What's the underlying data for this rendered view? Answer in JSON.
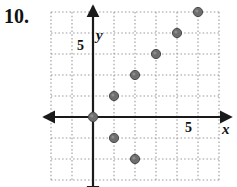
{
  "problem": {
    "number": "10."
  },
  "graph": {
    "axis_labels": {
      "x": "x",
      "y": "y"
    },
    "tick_labels": {
      "x_five": "5",
      "y_five": "5"
    },
    "colors": {
      "axis": "#1a1a1a",
      "grid": "#9a9a9a",
      "point": "#6e6e6e",
      "point_edge": "#4a4a4a",
      "background": "#ffffff"
    }
  },
  "chart_data": {
    "type": "scatter",
    "title": "",
    "xlabel": "x",
    "ylabel": "y",
    "xlim": [
      -2,
      6
    ],
    "ylim": [
      -3,
      5
    ],
    "xticks": [
      5
    ],
    "yticks": [
      5
    ],
    "grid": true,
    "grid_spacing": 1,
    "legend": null,
    "series": [
      {
        "name": "plotted points",
        "points": [
          [
            0,
            0
          ],
          [
            1,
            1
          ],
          [
            2,
            2
          ],
          [
            3,
            3
          ],
          [
            4,
            4
          ],
          [
            5,
            5
          ],
          [
            1,
            -1
          ],
          [
            2,
            -2
          ]
        ]
      }
    ]
  }
}
